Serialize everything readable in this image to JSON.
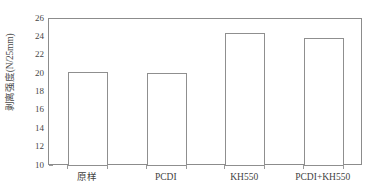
{
  "chart_data": {
    "type": "bar",
    "title": "",
    "subtitle": "",
    "xlabel": "",
    "ylabel": "剥离强度(N/25mm)",
    "categories": [
      "原样",
      "PCDI",
      "KH550",
      "PCDI+KH550"
    ],
    "values": [
      20.2,
      20.1,
      24.5,
      23.9
    ],
    "series": [
      {
        "name": "剥离强度",
        "values": [
          20.2,
          20.1,
          24.5,
          23.9
        ]
      }
    ],
    "ylim": [
      10,
      26
    ],
    "y_ticks": [
      10,
      12,
      14,
      16,
      18,
      20,
      22,
      24,
      26
    ],
    "y_tick_labels": [
      "10",
      "12",
      "14",
      "16",
      "18",
      "20",
      "22",
      "24",
      "26"
    ],
    "grid": false,
    "legend": "none",
    "bar_style": {
      "fill": "#ffffff",
      "edge_color": "#8f8f8f"
    },
    "axis_color": "#8c8c8c",
    "text_color": "#3f3f3f",
    "background": "#ffffff"
  }
}
